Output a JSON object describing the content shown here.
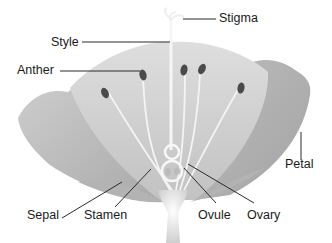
{
  "diagram": {
    "labels": {
      "stigma": "Stigma",
      "style": "Style",
      "anther": "Anther",
      "petal": "Petal",
      "sepal": "Sepal",
      "stamen": "Stamen",
      "ovule": "Ovule",
      "ovary": "Ovary"
    },
    "colors": {
      "petal_light": "#d6d6d6",
      "petal_mid": "#bdbdbd",
      "petal_dark": "#a6a6a6",
      "anther": "#4a4a4a",
      "filament": "#f2f2f2",
      "leader_line": "#2b2b2b"
    }
  }
}
